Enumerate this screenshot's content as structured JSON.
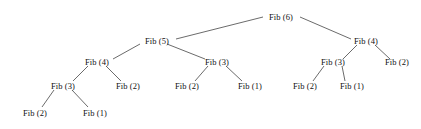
{
  "diagram": {
    "type": "recursion-tree",
    "width": 421,
    "height": 129,
    "background_color": "#ffffff",
    "edge_color": "#5a5a5a",
    "text_color": "#111111",
    "node_shape": "text-only",
    "root_id": "n0"
  },
  "nodes": [
    {
      "id": "n0",
      "label": "Fib (6)",
      "value": 6,
      "depth": 0,
      "x": 281,
      "y": 17
    },
    {
      "id": "n1",
      "label": "Fib (5)",
      "value": 5,
      "depth": 1,
      "x": 157,
      "y": 41
    },
    {
      "id": "n2",
      "label": "Fib (4)",
      "value": 4,
      "depth": 1,
      "x": 366,
      "y": 41
    },
    {
      "id": "n3",
      "label": "Fib (4)",
      "value": 4,
      "depth": 2,
      "x": 97,
      "y": 62
    },
    {
      "id": "n4",
      "label": "Fib (3)",
      "value": 3,
      "depth": 2,
      "x": 217,
      "y": 62
    },
    {
      "id": "n5",
      "label": "Fib (3)",
      "value": 3,
      "depth": 2,
      "x": 333,
      "y": 62
    },
    {
      "id": "n6",
      "label": "Fib (2)",
      "value": 2,
      "depth": 2,
      "x": 397,
      "y": 62
    },
    {
      "id": "n7",
      "label": "Fib (3)",
      "value": 3,
      "depth": 3,
      "x": 63,
      "y": 86
    },
    {
      "id": "n8",
      "label": "Fib (2)",
      "value": 2,
      "depth": 3,
      "x": 128,
      "y": 86
    },
    {
      "id": "n9",
      "label": "Fib (2)",
      "value": 2,
      "depth": 3,
      "x": 187,
      "y": 86
    },
    {
      "id": "n10",
      "label": "Fib (1)",
      "value": 1,
      "depth": 3,
      "x": 250,
      "y": 86
    },
    {
      "id": "n11",
      "label": "Fib (2)",
      "value": 2,
      "depth": 3,
      "x": 305,
      "y": 86
    },
    {
      "id": "n12",
      "label": "Fib (1)",
      "value": 1,
      "depth": 3,
      "x": 352,
      "y": 86
    },
    {
      "id": "n13",
      "label": "Fib (2)",
      "value": 2,
      "depth": 4,
      "x": 35,
      "y": 113
    },
    {
      "id": "n14",
      "label": "Fib (1)",
      "value": 1,
      "depth": 4,
      "x": 95,
      "y": 113
    }
  ],
  "edges": [
    {
      "from": "n0",
      "to": "n1",
      "x1": 263,
      "y1": 17,
      "x2": 176,
      "y2": 39
    },
    {
      "from": "n0",
      "to": "n2",
      "x1": 300,
      "y1": 17,
      "x2": 351,
      "y2": 39
    },
    {
      "from": "n1",
      "to": "n3",
      "x1": 140,
      "y1": 44,
      "x2": 113,
      "y2": 59
    },
    {
      "from": "n1",
      "to": "n4",
      "x1": 167,
      "y1": 44,
      "x2": 205,
      "y2": 59
    },
    {
      "from": "n2",
      "to": "n5",
      "x1": 357,
      "y1": 45,
      "x2": 343,
      "y2": 59
    },
    {
      "from": "n2",
      "to": "n6",
      "x1": 375,
      "y1": 45,
      "x2": 390,
      "y2": 59
    },
    {
      "from": "n3",
      "to": "n7",
      "x1": 88,
      "y1": 66,
      "x2": 73,
      "y2": 81
    },
    {
      "from": "n3",
      "to": "n8",
      "x1": 106,
      "y1": 66,
      "x2": 121,
      "y2": 81
    },
    {
      "from": "n4",
      "to": "n9",
      "x1": 208,
      "y1": 66,
      "x2": 195,
      "y2": 81
    },
    {
      "from": "n4",
      "to": "n10",
      "x1": 226,
      "y1": 66,
      "x2": 242,
      "y2": 81
    },
    {
      "from": "n5",
      "to": "n11",
      "x1": 324,
      "y1": 66,
      "x2": 313,
      "y2": 81
    },
    {
      "from": "n5",
      "to": "n12",
      "x1": 342,
      "y1": 66,
      "x2": 345,
      "y2": 81
    },
    {
      "from": "n7",
      "to": "n13",
      "x1": 54,
      "y1": 90,
      "x2": 42,
      "y2": 107
    },
    {
      "from": "n7",
      "to": "n14",
      "x1": 72,
      "y1": 90,
      "x2": 88,
      "y2": 107
    }
  ]
}
